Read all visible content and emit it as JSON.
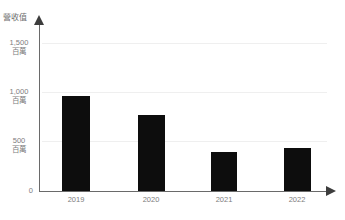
{
  "chart_data": {
    "type": "bar",
    "title": "",
    "subtitle": "",
    "xlabel": "",
    "ylabel": "營收值",
    "categories": [
      "2019",
      "2020",
      "2021",
      "2022"
    ],
    "values": [
      960,
      770,
      395,
      435
    ],
    "series": [
      {
        "name": "營收值",
        "values": [
          960,
          770,
          395,
          435
        ],
        "color": "#0d0d0d"
      }
    ],
    "ylim": [
      0,
      1700
    ],
    "y_ticks": [
      {
        "value": 0,
        "label": "0",
        "unit": ""
      },
      {
        "value": 500,
        "label": "500",
        "unit": "百萬"
      },
      {
        "value": 1000,
        "label": "1,000",
        "unit": "百萬"
      },
      {
        "value": 1500,
        "label": "1,500",
        "unit": "百萬"
      }
    ],
    "grid": true,
    "grid_axis": "y",
    "legend": false,
    "legend_position": "none",
    "annotations": [],
    "unit_suffix": "百萬"
  },
  "axis": {
    "y_title": "營收值",
    "y_axis_color": "#6a6a6a",
    "x_axis_color": "#6a6a6a",
    "grid_color": "#efefef",
    "tick_label_color": "#7d7d7d"
  },
  "caption": {
    "text": ""
  },
  "colors": {
    "bar": "#0d0d0d",
    "background": "#ffffff",
    "grid": "#efefef",
    "axis": "#6a6a6a",
    "text": "#7d7d7d"
  }
}
